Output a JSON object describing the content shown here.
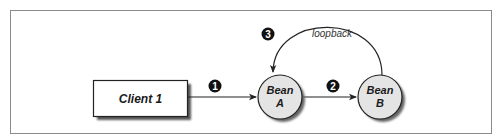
{
  "diagram": {
    "nodes": {
      "client": {
        "label": "Client 1",
        "shape": "rectangle"
      },
      "bean_a": {
        "line1": "Bean",
        "line2": "A",
        "shape": "circle"
      },
      "bean_b": {
        "line1": "Bean",
        "line2": "B",
        "shape": "circle"
      }
    },
    "edges": [
      {
        "from": "Client 1",
        "to": "Bean A",
        "step": "1"
      },
      {
        "from": "Bean A",
        "to": "Bean B",
        "step": "2"
      },
      {
        "from": "Bean B",
        "to": "Bean A",
        "step": "3",
        "label": "loopback"
      }
    ],
    "badges": {
      "step1": "1",
      "step2": "2",
      "step3": "3"
    },
    "loopback_label": "loopback",
    "colors": {
      "frame": "#8a8a8a",
      "node_fill": "#e4e4e4",
      "stroke": "#222222",
      "badge": "#111111",
      "shadow": "#555555"
    }
  }
}
